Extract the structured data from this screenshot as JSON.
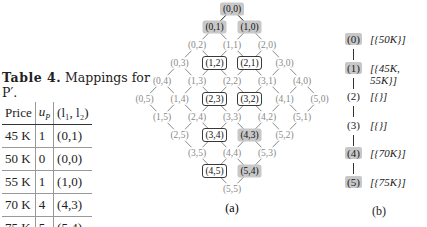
{
  "table": {
    "caption_label": "Table 4.",
    "caption_text": " Mappings for P′.",
    "headers": [
      "Price",
      "u_P",
      "(l1, l2)"
    ],
    "header_display": [
      "Price",
      "uP",
      "(l₁, l₂)"
    ],
    "rows": [
      {
        "price": "45 K",
        "u": "1",
        "pair": "(0,1)"
      },
      {
        "price": "50 K",
        "u": "0",
        "pair": "(0,0)"
      },
      {
        "price": "55 K",
        "u": "1",
        "pair": "(1,0)"
      },
      {
        "price": "70 K",
        "u": "4",
        "pair": "(4,3)"
      },
      {
        "price": "75 K",
        "u": "5",
        "pair": "(5,4)"
      }
    ]
  },
  "lattice": {
    "label": "(a)",
    "max": 5,
    "shaded": [
      "0,0",
      "0,1",
      "1,0",
      "4,3",
      "5,4"
    ],
    "boxed": [
      "1,2",
      "2,1",
      "2,3",
      "3,2",
      "3,4",
      "4,5"
    ],
    "colors": {
      "shade": "#c8c8c8",
      "dim_text": "#8a8a8a",
      "edge": "#333333"
    }
  },
  "chain": {
    "label": "(b)",
    "items": [
      {
        "level": "(0)",
        "set": "[{50K}]",
        "shaded": true
      },
      {
        "level": "(1)",
        "set": "[{45K, 55K}]",
        "shaded": true
      },
      {
        "level": "(2)",
        "set": "[{}]",
        "shaded": false
      },
      {
        "level": "(3)",
        "set": "[{}]",
        "shaded": false
      },
      {
        "level": "(4)",
        "set": "[{70K}]",
        "shaded": true
      },
      {
        "level": "(5)",
        "set": "[{75K}]",
        "shaded": true
      }
    ]
  }
}
